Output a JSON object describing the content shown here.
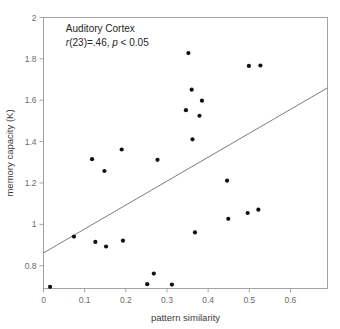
{
  "chart_data": {
    "type": "scatter",
    "title": "",
    "xlabel": "pattern similarity",
    "ylabel": "memory capacity (K)",
    "xlim": [
      0,
      0.69
    ],
    "ylim": [
      0.69,
      2.0
    ],
    "xticks": [
      0,
      0.1,
      0.2,
      0.3,
      0.4,
      0.5,
      0.6
    ],
    "xtick_labels": [
      "0",
      "0.1",
      "0.2",
      "0.3",
      "0.4",
      "0.5",
      "0.6"
    ],
    "yticks": [
      0.8,
      1.0,
      1.2,
      1.4,
      1.6,
      1.8,
      2.0
    ],
    "ytick_labels": [
      "0.8",
      "1",
      "1.2",
      "1.4",
      "1.6",
      "1.8",
      "2"
    ],
    "grid": false,
    "legend": null,
    "annotations": [
      {
        "text": "Auditory Cortex",
        "italic": false,
        "x": 0.03,
        "y": 1.93
      },
      {
        "text": "r(23)=.46, p < 0.05",
        "italic": true,
        "x": 0.03,
        "y": 1.86
      }
    ],
    "annotation_region": "Auditory Cortex",
    "stat_r": ".46",
    "stat_df": "23",
    "stat_p": "p < 0.05",
    "marker_color": "#111111",
    "line_color": "#6e6e6e",
    "axis_color": "#9a9a9a",
    "trendline": {
      "type": "linear-fit",
      "x0": 0.0,
      "y0": 0.862,
      "x1": 0.69,
      "y1": 1.66
    },
    "points": [
      {
        "x": 0.016,
        "y": 0.698
      },
      {
        "x": 0.074,
        "y": 0.941
      },
      {
        "x": 0.118,
        "y": 1.315
      },
      {
        "x": 0.126,
        "y": 0.915
      },
      {
        "x": 0.148,
        "y": 1.258
      },
      {
        "x": 0.152,
        "y": 0.893
      },
      {
        "x": 0.19,
        "y": 1.362
      },
      {
        "x": 0.193,
        "y": 0.921
      },
      {
        "x": 0.252,
        "y": 0.711
      },
      {
        "x": 0.268,
        "y": 0.762
      },
      {
        "x": 0.277,
        "y": 1.312
      },
      {
        "x": 0.312,
        "y": 0.709
      },
      {
        "x": 0.346,
        "y": 1.552
      },
      {
        "x": 0.352,
        "y": 1.828
      },
      {
        "x": 0.36,
        "y": 1.651
      },
      {
        "x": 0.362,
        "y": 1.411
      },
      {
        "x": 0.368,
        "y": 0.961
      },
      {
        "x": 0.379,
        "y": 1.525
      },
      {
        "x": 0.385,
        "y": 1.598
      },
      {
        "x": 0.446,
        "y": 1.211
      },
      {
        "x": 0.449,
        "y": 1.027
      },
      {
        "x": 0.496,
        "y": 1.055
      },
      {
        "x": 0.499,
        "y": 1.766
      },
      {
        "x": 0.522,
        "y": 1.071
      },
      {
        "x": 0.527,
        "y": 1.768
      }
    ]
  },
  "figure": {
    "background_color": "#ffffff"
  }
}
